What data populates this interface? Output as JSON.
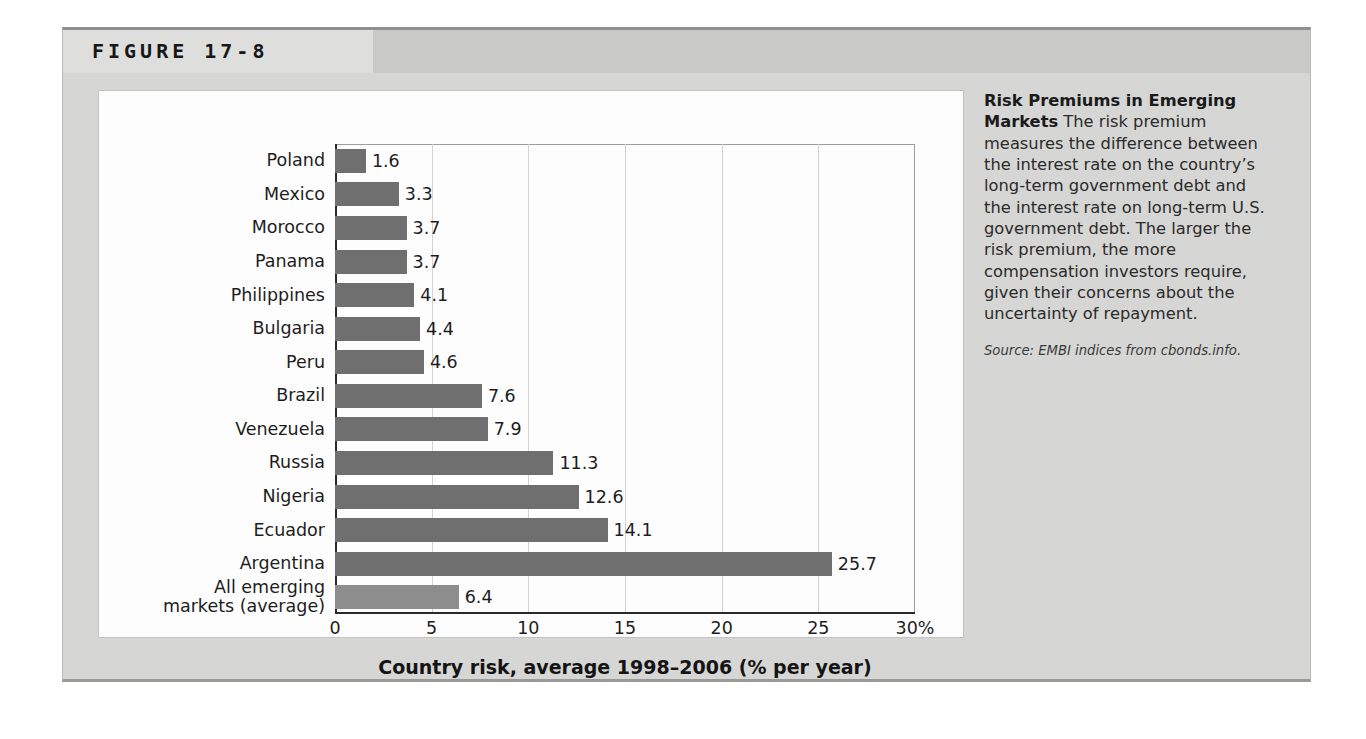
{
  "figure": {
    "title": "FIGURE 17-8"
  },
  "caption": {
    "heading": "Risk Premiums in Emerging Markets",
    "body": " The risk premium measures the difference between the interest rate on the country’s long-term government debt and the interest rate on long-term U.S. government debt. The larger the risk premium, the more compensation investors require, given their concerns about the uncertainty of repayment.",
    "source": "Source: EMBI indices from cbonds.info."
  },
  "colors": {
    "bar_country": "#6f6f6f",
    "bar_average": "#8d8d8d",
    "panel_background": "#fdfdfd",
    "figure_background": "#d6d6d4",
    "header_band": "#c9c9c7",
    "header_band_left": "#dededc",
    "gridline": "#d2d2d0",
    "axis": "#2a2a2a"
  },
  "chart_data": {
    "type": "bar",
    "orientation": "horizontal",
    "title": "",
    "xlabel": "Country risk, average 1998–2006 (% per year)",
    "ylabel": "",
    "xlim": [
      0,
      30
    ],
    "xticks": [
      0,
      5,
      10,
      15,
      20,
      25,
      30
    ],
    "xtick_labels": [
      "0",
      "5",
      "10",
      "15",
      "20",
      "25",
      "30%"
    ],
    "grid": "vertical",
    "legend": "none",
    "value_label_format": "one-decimal",
    "categories": [
      "Poland",
      "Mexico",
      "Morocco",
      "Panama",
      "Philippines",
      "Bulgaria",
      "Peru",
      "Brazil",
      "Venezuela",
      "Russia",
      "Nigeria",
      "Ecuador",
      "Argentina",
      "All emerging markets (average)"
    ],
    "values": [
      1.6,
      3.3,
      3.7,
      3.7,
      4.1,
      4.4,
      4.6,
      7.6,
      7.9,
      11.3,
      12.6,
      14.1,
      25.7,
      6.4
    ],
    "value_labels": [
      "1.6",
      "3.3",
      "3.7",
      "3.7",
      "4.1",
      "4.4",
      "4.6",
      "7.6",
      "7.9",
      "11.3",
      "12.6",
      "14.1",
      "25.7",
      "6.4"
    ],
    "category_label_lines": [
      [
        "Poland"
      ],
      [
        "Mexico"
      ],
      [
        "Morocco"
      ],
      [
        "Panama"
      ],
      [
        "Philippines"
      ],
      [
        "Bulgaria"
      ],
      [
        "Peru"
      ],
      [
        "Brazil"
      ],
      [
        "Venezuela"
      ],
      [
        "Russia"
      ],
      [
        "Nigeria"
      ],
      [
        "Ecuador"
      ],
      [
        "Argentina"
      ],
      [
        "All emerging",
        "markets (average)"
      ]
    ],
    "bar_colors": [
      "#6f6f6f",
      "#6f6f6f",
      "#6f6f6f",
      "#6f6f6f",
      "#6f6f6f",
      "#6f6f6f",
      "#6f6f6f",
      "#6f6f6f",
      "#6f6f6f",
      "#6f6f6f",
      "#6f6f6f",
      "#6f6f6f",
      "#6f6f6f",
      "#8d8d8d"
    ]
  }
}
